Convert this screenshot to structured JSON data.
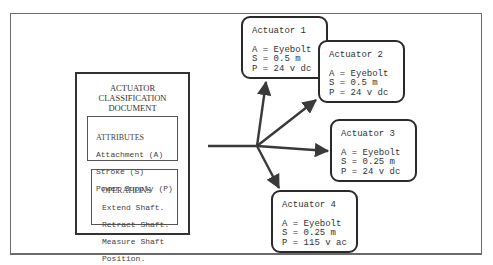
{
  "diagram": {
    "document": {
      "title": "ACTUATOR\nCLASSIFICATION\nDOCUMENT",
      "attributes": {
        "heading": "ATTRIBUTES",
        "items": [
          "Attachment (A)",
          "Stroke (S)",
          "Power Supply (P)"
        ]
      },
      "operations": {
        "heading": "OPERATIONS",
        "items": [
          "Extend Shaft.",
          "Retract Shaft.",
          "Measure Shaft",
          "Position."
        ]
      }
    },
    "actuators": [
      {
        "name": "Actuator 1",
        "A": "A = Eyebolt",
        "S": "S = 0.5 m",
        "P": "P = 24 v dc"
      },
      {
        "name": "Actuator 2",
        "A": "A = Eyebolt",
        "S": "S = 0.5 m",
        "P": "P = 24 v dc"
      },
      {
        "name": "Actuator 3",
        "A": "A = Eyebolt",
        "S": "S = 0.25 m",
        "P": "P = 24 v dc"
      },
      {
        "name": "Actuator 4",
        "A": "A = Eyebolt",
        "S": "S = 0.25 m",
        "P": "P = 115 v ac"
      }
    ],
    "edges": [
      {
        "from": "document",
        "to": "Actuator 1"
      },
      {
        "from": "document",
        "to": "Actuator 2"
      },
      {
        "from": "document",
        "to": "Actuator 3"
      },
      {
        "from": "document",
        "to": "Actuator 4"
      }
    ],
    "colors": {
      "line": "#3a3a3a",
      "text": "#333333",
      "background": "#ffffff"
    }
  }
}
